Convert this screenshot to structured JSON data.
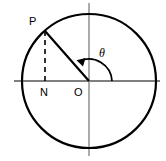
{
  "figure": {
    "type": "geometry-diagram",
    "background_color": "#ffffff",
    "stroke_color": "#000000",
    "axis_color": "#4d4d4d",
    "labels": {
      "point_p": "P",
      "point_n": "N",
      "origin": "O",
      "angle": "θ"
    },
    "geometry": {
      "center": {
        "x": 89,
        "y": 81
      },
      "radius": 67,
      "point_p": {
        "x": 45,
        "y": 31
      },
      "point_n": {
        "x": 45,
        "y": 81
      },
      "angle_degrees": 131,
      "arc_radius": 23,
      "h_axis": {
        "x1": 14,
        "x2": 160,
        "y": 81
      },
      "v_axis": {
        "x": 89,
        "y1": 3,
        "y2": 156
      }
    },
    "label_positions": {
      "point_p": {
        "x": 29,
        "y": 25
      },
      "point_n": {
        "x": 40,
        "y": 96
      },
      "origin": {
        "x": 74,
        "y": 96
      },
      "angle": {
        "x": 99,
        "y": 57
      }
    }
  }
}
